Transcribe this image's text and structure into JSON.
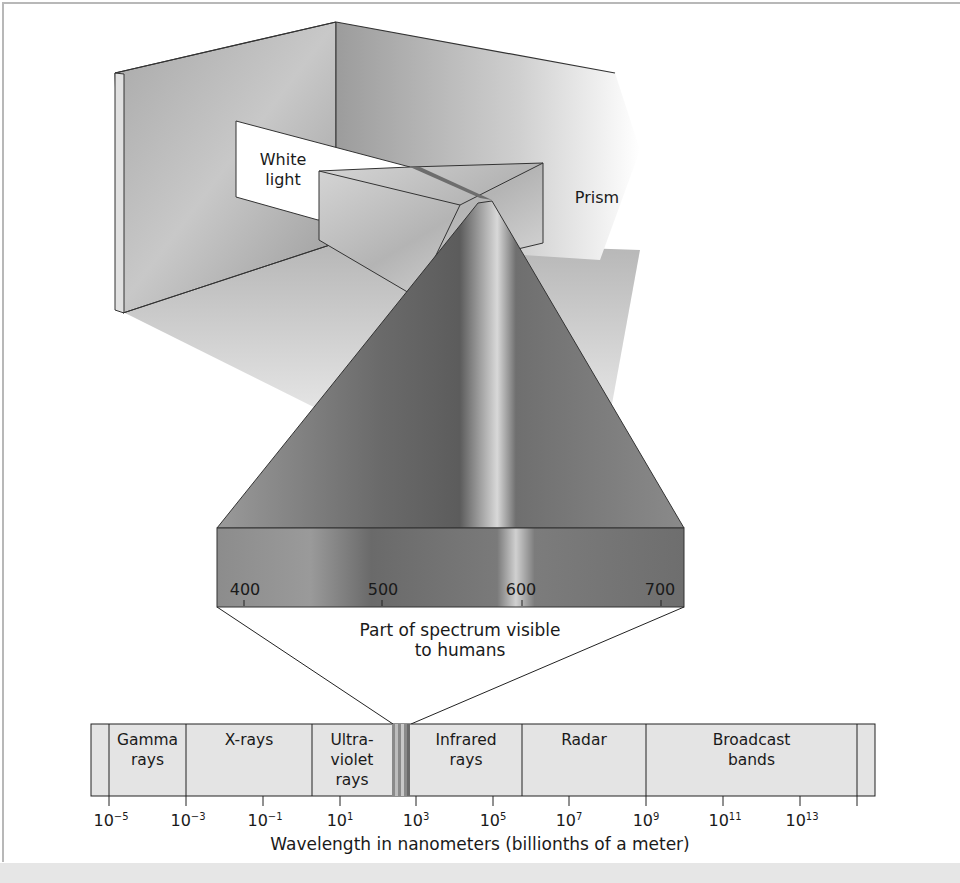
{
  "figure": {
    "labels": {
      "white_light": [
        "White",
        "light"
      ],
      "prism": "Prism",
      "visible_part": [
        "Part of spectrum visible",
        "to humans"
      ]
    },
    "visible_scale": {
      "ticks": [
        "400",
        "500",
        "600",
        "700"
      ]
    },
    "spectrum_bar": {
      "bands": [
        {
          "name": "Gamma rays",
          "lines": [
            "Gamma",
            "rays"
          ]
        },
        {
          "name": "X-rays",
          "lines": [
            "X-rays"
          ]
        },
        {
          "name": "Ultraviolet rays",
          "lines": [
            "Ultra-",
            "violet",
            "rays"
          ]
        },
        {
          "name": "Visible",
          "lines": []
        },
        {
          "name": "Infrared rays",
          "lines": [
            "Infrared",
            "rays"
          ]
        },
        {
          "name": "Radar",
          "lines": [
            "Radar"
          ]
        },
        {
          "name": "Broadcast bands",
          "lines": [
            "Broadcast",
            "bands"
          ]
        }
      ],
      "ticks": [
        {
          "base": "10",
          "exp": "−5"
        },
        {
          "base": "10",
          "exp": "−3"
        },
        {
          "base": "10",
          "exp": "−1"
        },
        {
          "base": "10",
          "exp": "1"
        },
        {
          "base": "10",
          "exp": "3"
        },
        {
          "base": "10",
          "exp": "5"
        },
        {
          "base": "10",
          "exp": "7"
        },
        {
          "base": "10",
          "exp": "9"
        },
        {
          "base": "10",
          "exp": "11"
        },
        {
          "base": "10",
          "exp": "13"
        }
      ],
      "axis_title": "Wavelength in nanometers (billionths of a meter)"
    }
  }
}
